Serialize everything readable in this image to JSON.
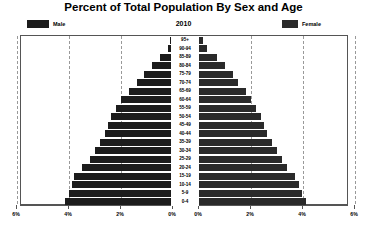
{
  "chart_data": {
    "type": "bar",
    "subtype": "population-pyramid",
    "title": "Percent of Total Population By Sex and Age",
    "year": "2010",
    "xlabel": "",
    "ylabel": "",
    "grid": true,
    "legend_position": "top",
    "xlim": [
      0,
      8
    ],
    "xtick_labels_left": [
      "8%",
      "6%",
      "4%",
      "2%",
      "0%"
    ],
    "xtick_labels_right": [
      "0%",
      "2%",
      "4%",
      "6%",
      "8%"
    ],
    "xtick_values": [
      8,
      6,
      4,
      2,
      0,
      0,
      2,
      4,
      6,
      8
    ],
    "categories": [
      "95+",
      "90-94",
      "85-89",
      "80-84",
      "75-79",
      "70-74",
      "65-69",
      "60-64",
      "55-59",
      "50-54",
      "45-49",
      "40-44",
      "35-39",
      "30-34",
      "25-29",
      "20-24",
      "15-19",
      "10-14",
      "5-9",
      "0-4"
    ],
    "series": [
      {
        "name": "Male",
        "color": "#1c1c1c",
        "side": "left",
        "values": [
          0.1,
          0.2,
          0.5,
          0.8,
          1.1,
          1.4,
          1.7,
          2.0,
          2.2,
          2.4,
          2.5,
          2.6,
          2.8,
          3.0,
          3.2,
          3.5,
          3.8,
          3.9,
          4.0,
          4.15
        ]
      },
      {
        "name": "Female",
        "color": "#2a2a2a",
        "side": "right",
        "values": [
          0.15,
          0.3,
          0.7,
          1.0,
          1.3,
          1.5,
          1.8,
          2.0,
          2.2,
          2.4,
          2.5,
          2.6,
          2.8,
          3.0,
          3.2,
          3.4,
          3.7,
          3.85,
          3.95,
          4.1
        ]
      }
    ]
  },
  "legend": {
    "male_label": "Male",
    "female_label": "Female",
    "male_color": "#1c1c1c",
    "female_color": "#2a2a2a"
  }
}
